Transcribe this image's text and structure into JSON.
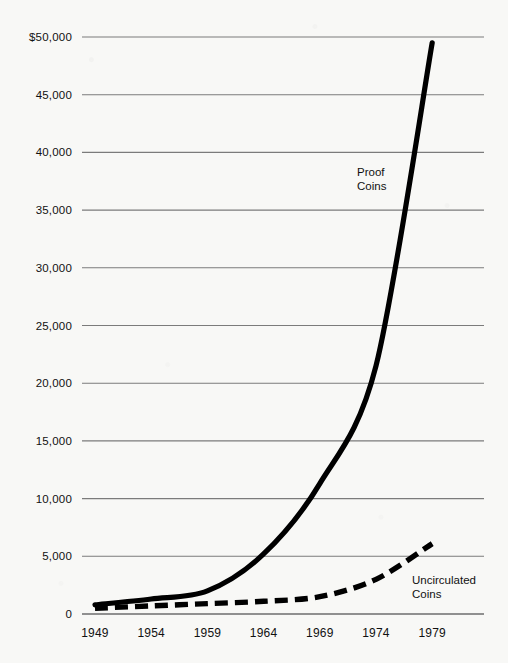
{
  "chart_data": {
    "type": "line",
    "title": "",
    "xlabel": "",
    "ylabel": "",
    "x": [
      1949,
      1954,
      1959,
      1964,
      1969,
      1974,
      1979
    ],
    "categories": [
      "1949",
      "1954",
      "1959",
      "1964",
      "1969",
      "1974",
      "1979"
    ],
    "ylim": [
      0,
      50000
    ],
    "xlim": [
      1949,
      1979
    ],
    "grid": true,
    "legend_position": "inline-annotations",
    "ytick_labels": [
      "$50,000",
      "45,000",
      "40,000",
      "35,000",
      "30,000",
      "25,000",
      "20,000",
      "15,000",
      "10,000",
      "5,000",
      "0"
    ],
    "ytick_values": [
      50000,
      45000,
      40000,
      35000,
      30000,
      25000,
      20000,
      15000,
      10000,
      5000,
      0
    ],
    "series": [
      {
        "name": "Proof Coins",
        "style": "solid",
        "color": "#000000",
        "values": [
          800,
          1300,
          2000,
          5200,
          11300,
          21500,
          49500
        ]
      },
      {
        "name": "Uncirculated Coins",
        "style": "dashed",
        "color": "#000000",
        "values": [
          500,
          700,
          900,
          1100,
          1500,
          3000,
          6100
        ]
      }
    ],
    "annotations": [
      {
        "text_line1": "Proof",
        "text_line2": "Coins",
        "series": "Proof Coins"
      },
      {
        "text_line1": "Uncirculated",
        "text_line2": "Coins",
        "series": "Uncirculated Coins"
      }
    ]
  },
  "colors": {
    "background": "#f8f8f6",
    "ink": "#000000",
    "gridline": "#7b7b7b"
  }
}
